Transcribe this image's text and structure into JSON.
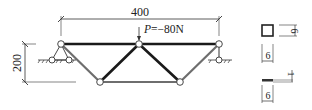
{
  "diagram": {
    "type": "truss",
    "span_label": "400",
    "height_label": "200",
    "load_label": "P=−80N",
    "colors": {
      "thick_member": "#1a1a1a",
      "thin_member": "#6e6e6e",
      "node_fill": "#ffffff",
      "ink": "#222222"
    },
    "nodes": [
      {
        "id": "A",
        "x": 61,
        "y": 44
      },
      {
        "id": "B",
        "x": 139,
        "y": 44
      },
      {
        "id": "C",
        "x": 219,
        "y": 44
      },
      {
        "id": "D",
        "x": 100,
        "y": 82
      },
      {
        "id": "E",
        "x": 180,
        "y": 82
      }
    ],
    "members": [
      {
        "from": "A",
        "to": "B",
        "kind": "thick"
      },
      {
        "from": "B",
        "to": "C",
        "kind": "thick"
      },
      {
        "from": "B",
        "to": "D",
        "kind": "thick"
      },
      {
        "from": "B",
        "to": "E",
        "kind": "thick"
      },
      {
        "from": "A",
        "to": "D",
        "kind": "thin"
      },
      {
        "from": "C",
        "to": "E",
        "kind": "thin"
      },
      {
        "from": "D",
        "to": "E",
        "kind": "thin"
      }
    ],
    "supports": [
      {
        "node": "A",
        "type": "pinned"
      },
      {
        "node": "C",
        "type": "roller"
      }
    ]
  },
  "legend": {
    "square_section": {
      "dimension_label": "6"
    },
    "square_width": {
      "dimension_label": "6"
    },
    "flat_section": {
      "thickness_label": "1",
      "width_label": "6"
    }
  }
}
